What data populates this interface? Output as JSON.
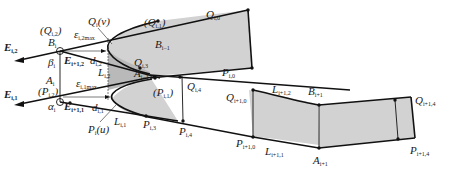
{
  "diagram": {
    "colors": {
      "shade_light": "#d2d2d2",
      "shade_dark": "#b9b9b9",
      "line": "#111111",
      "background": "#ffffff"
    },
    "labels": {
      "E_i2": {
        "main": "E",
        "sub": "i,2"
      },
      "E_i1": {
        "main": "E",
        "sub": "i,1"
      },
      "Qi2_paren": {
        "main": "(Q",
        "sub": "i,2",
        "tail": ")"
      },
      "Pi2_paren": {
        "main": "(P",
        "sub": "i,2",
        "tail": ")"
      },
      "B_i": {
        "main": "B",
        "sub": "i"
      },
      "beta_i": {
        "main": "β",
        "sub": "i"
      },
      "A_i": {
        "main": "A",
        "sub": "i"
      },
      "alpha_i": {
        "main": "α",
        "sub": "i"
      },
      "E_i1_2": {
        "main": "E",
        "sub": "i+1,2"
      },
      "E_i1_1": {
        "main": "E",
        "sub": "i+1,1"
      },
      "eps_i2max": {
        "main": "ε",
        "sub": "i,2max"
      },
      "eps_i1max": {
        "main": "ε",
        "sub": "i,1max"
      },
      "d_i2": {
        "main": "d",
        "sub": "i,2"
      },
      "d_i1": {
        "main": "d",
        "sub": "i,1"
      },
      "L_i2": {
        "main": "L",
        "sub": "i,2"
      },
      "L_i1": {
        "main": "L",
        "sub": "i,1"
      },
      "Q_v": {
        "main": "Q",
        "sub": "i",
        "tail": "(v)"
      },
      "P_u": {
        "main": "P",
        "sub": "i",
        "tail": "(u)"
      },
      "Qi1_paren": {
        "main": "(Q",
        "sub": "i,1",
        "tail": ")"
      },
      "Pi1_paren": {
        "main": "(P",
        "sub": "i,1",
        "tail": ")"
      },
      "B_im1": {
        "main": "B",
        "sub": "i−1"
      },
      "A_im1": {
        "main": "A",
        "sub": "i−1"
      },
      "Q_i3": {
        "main": "Q",
        "sub": "i,3"
      },
      "P_i3": {
        "main": "P",
        "sub": "i,3"
      },
      "Q_i0": {
        "main": "Q",
        "sub": "i,0"
      },
      "P_i0": {
        "main": "P",
        "sub": "i,0"
      },
      "Q_i4": {
        "main": "Q",
        "sub": "i,4"
      },
      "P_i4": {
        "main": "P",
        "sub": "i,4"
      },
      "Q_i1_0": {
        "main": "Q",
        "sub": "i+1,0"
      },
      "P_i1_0": {
        "main": "P",
        "sub": "i+1,0"
      },
      "L_i1_2": {
        "main": "L",
        "sub": "i+1,2"
      },
      "L_i1_1": {
        "main": "L",
        "sub": "i+1,1"
      },
      "B_ip1": {
        "main": "B",
        "sub": "i+1"
      },
      "A_ip1": {
        "main": "A",
        "sub": "i+1"
      },
      "Q_i1_4": {
        "main": "Q",
        "sub": "i+1,4"
      },
      "P_i1_4": {
        "main": "P",
        "sub": "i+1,4"
      }
    }
  }
}
